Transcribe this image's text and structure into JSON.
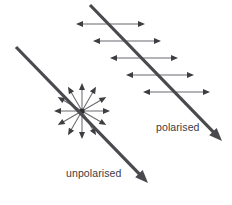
{
  "figure": {
    "background_color": "#ffffff",
    "width": 232,
    "height": 205
  },
  "labels": {
    "polarised": "polarised",
    "unpolarised": "unpolarised"
  },
  "colors": {
    "ray_stroke": "#4a4a4e",
    "oscillation_stroke": "#6b6b70",
    "arrow_head": "#3e3e42",
    "label_text": "#3b3b3f",
    "background": "#ffffff"
  },
  "rays": [
    {
      "name": "polarised-ray",
      "x1": 90,
      "y1": 5,
      "x2": 222,
      "y2": 141,
      "stroke_width": 3.2,
      "arrowhead": "end"
    },
    {
      "name": "unpolarised-ray",
      "x1": 16,
      "y1": 47,
      "x2": 148,
      "y2": 183,
      "stroke_width": 3.2,
      "arrowhead": "end"
    }
  ],
  "oscillations": {
    "count": 5,
    "type": "double-headed-horizontal",
    "arrows": [
      {
        "x1": 76,
        "x2": 145,
        "y": 24
      },
      {
        "x1": 93,
        "x2": 161,
        "y": 41
      },
      {
        "x1": 110,
        "x2": 178,
        "y": 58
      },
      {
        "x1": 126,
        "x2": 194,
        "y": 75
      },
      {
        "x1": 143,
        "x2": 210,
        "y": 92
      }
    ]
  },
  "starburst": {
    "name": "unpolarised-oscillation-burst",
    "center_x": 82,
    "center_y": 111,
    "radius": 28,
    "ray_count": 12,
    "angles_deg": [
      0,
      30,
      60,
      90,
      120,
      150,
      180,
      210,
      240,
      270,
      300,
      330
    ]
  },
  "chart_data": {
    "type": "diagram",
    "annotations": [
      "polarised",
      "unpolarised"
    ]
  }
}
